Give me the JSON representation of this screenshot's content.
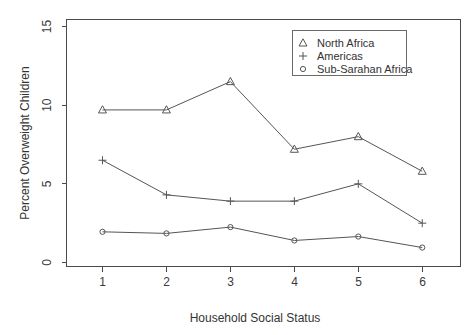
{
  "chart_data": {
    "type": "line",
    "title": "",
    "xlabel": "Household Social Status",
    "ylabel": "Percent Overweight Children",
    "categories": [
      "1",
      "2",
      "3",
      "4",
      "5",
      "6"
    ],
    "x": [
      1,
      2,
      3,
      4,
      5,
      6
    ],
    "xlim": [
      0.62,
      6.38
    ],
    "ylim": [
      -0.35,
      15.5
    ],
    "xticks": [
      "1",
      "2",
      "3",
      "4",
      "5",
      "6"
    ],
    "yticks": [
      "0",
      "5",
      "10",
      "15"
    ],
    "ytick_values": [
      0,
      5,
      10,
      15
    ],
    "grid": false,
    "legend_position": "top-right",
    "series": [
      {
        "name": "North Africa",
        "marker": "triangle",
        "values": [
          9.7,
          9.7,
          11.5,
          7.2,
          8.0,
          5.8
        ]
      },
      {
        "name": "Americas",
        "marker": "plus",
        "values": [
          6.5,
          4.3,
          3.9,
          3.9,
          5.0,
          2.5
        ]
      },
      {
        "name": "Sub-Sarahan Africa",
        "marker": "circle",
        "values": [
          1.95,
          1.85,
          2.25,
          1.4,
          1.65,
          0.95
        ]
      }
    ],
    "colors": {
      "line": "#555555",
      "axis": "#4a4a4a",
      "text": "#333333",
      "background": "#ffffff",
      "legend_border": "#6a6a6a"
    }
  },
  "legend": {
    "entries": [
      {
        "label": "North Africa",
        "marker": "triangle"
      },
      {
        "label": "Americas",
        "marker": "plus"
      },
      {
        "label": "Sub-Sarahan Africa",
        "marker": "circle"
      }
    ]
  }
}
